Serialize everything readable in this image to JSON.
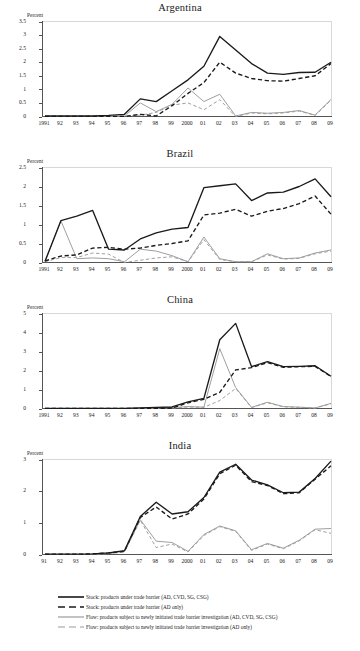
{
  "figure": {
    "ylabel": "Percent",
    "legend": [
      {
        "label": "Stock: products under trade barrier (AD, CVD, SG, CSG)",
        "color": "#1a1a1a",
        "style": "solid",
        "icon": "solid-black-line-icon"
      },
      {
        "label": "Stock: products under trade barrier (AD only)",
        "color": "#1a1a1a",
        "style": "dashed",
        "icon": "dashed-black-line-icon"
      },
      {
        "label": "Flow: products subject to newly initiated trade barrier investigation (AD, CVD, SG, CSG)",
        "color": "#9a9a9a",
        "style": "solid",
        "icon": "solid-gray-line-icon"
      },
      {
        "label": "Flow: products subject to newly initiated trade barrier investigation (AD only)",
        "color": "#9a9a9a",
        "style": "dashed",
        "icon": "dashed-gray-line-icon"
      }
    ]
  },
  "chart_data": [
    {
      "type": "line",
      "title": "Argentina",
      "xlabel": "",
      "ylabel": "Percent",
      "grid": false,
      "legend_position": "below-figure",
      "ylim": [
        0,
        3.5
      ],
      "yticks": [
        "0",
        "0.5",
        "1",
        "1.5",
        "2",
        "2.5",
        "3",
        "3.5"
      ],
      "x": [
        "1991",
        "92",
        "93",
        "94",
        "95",
        "96",
        "97",
        "98",
        "99",
        "2000",
        "01",
        "02",
        "03",
        "04",
        "05",
        "06",
        "07",
        "08",
        "09"
      ],
      "series": [
        {
          "name": "Stock: products under trade barrier (AD, CVD, SG, CSG)",
          "color": "#1a1a1a",
          "style": "solid",
          "values": [
            0.02,
            0.02,
            0.02,
            0.02,
            0.04,
            0.08,
            0.65,
            0.55,
            0.95,
            1.35,
            1.85,
            2.95,
            2.45,
            1.95,
            1.6,
            1.55,
            1.62,
            1.63,
            2.0
          ]
        },
        {
          "name": "Stock: products under trade barrier (AD only)",
          "color": "#1a1a1a",
          "style": "dashed",
          "values": [
            0.0,
            0.0,
            0.0,
            0.0,
            0.0,
            0.0,
            0.08,
            0.02,
            0.4,
            0.85,
            1.25,
            2.0,
            1.6,
            1.4,
            1.32,
            1.3,
            1.4,
            1.5,
            1.95
          ]
        },
        {
          "name": "Flow: products subject to newly initiated trade barrier investigation (AD, CVD, SG, CSG)",
          "color": "#9a9a9a",
          "style": "solid",
          "values": [
            0.0,
            0.0,
            0.0,
            0.0,
            0.0,
            0.02,
            0.5,
            0.18,
            0.45,
            1.05,
            0.55,
            0.82,
            0.02,
            0.15,
            0.12,
            0.15,
            0.22,
            0.05,
            0.63
          ]
        },
        {
          "name": "Flow: products subject to newly initiated trade barrier investigation (AD only)",
          "color": "#9a9a9a",
          "style": "dashed",
          "values": [
            0.0,
            0.0,
            0.0,
            0.0,
            0.0,
            0.0,
            0.05,
            0.15,
            0.42,
            0.5,
            0.25,
            0.62,
            0.0,
            0.13,
            0.1,
            0.13,
            0.2,
            0.04,
            0.6
          ]
        }
      ]
    },
    {
      "type": "line",
      "title": "Brazil",
      "xlabel": "",
      "ylabel": "Percent",
      "grid": false,
      "legend_position": "below-figure",
      "ylim": [
        0,
        2.5
      ],
      "yticks": [
        "0",
        "0.5",
        "1",
        "1.5",
        "2",
        "2.5"
      ],
      "x": [
        "1991",
        "92",
        "93",
        "94",
        "95",
        "96",
        "97",
        "98",
        "99",
        "2000",
        "01",
        "02",
        "03",
        "04",
        "05",
        "06",
        "07",
        "08",
        "09"
      ],
      "series": [
        {
          "name": "Stock: products under trade barrier (AD, CVD, SG, CSG)",
          "color": "#1a1a1a",
          "style": "solid",
          "values": [
            0.03,
            1.1,
            1.22,
            1.37,
            0.35,
            0.33,
            0.62,
            0.78,
            0.88,
            0.92,
            1.97,
            2.02,
            2.07,
            1.63,
            1.83,
            1.85,
            2.0,
            2.2,
            1.73
          ]
        },
        {
          "name": "Stock: products under trade barrier (AD only)",
          "color": "#1a1a1a",
          "style": "dashed",
          "values": [
            0.04,
            0.17,
            0.2,
            0.38,
            0.4,
            0.35,
            0.38,
            0.45,
            0.5,
            0.57,
            1.25,
            1.3,
            1.4,
            1.22,
            1.35,
            1.42,
            1.55,
            1.75,
            1.27
          ]
        },
        {
          "name": "Flow: products subject to newly initiated trade barrier investigation (AD, CVD, SG, CSG)",
          "color": "#9a9a9a",
          "style": "solid",
          "values": [
            0.02,
            1.1,
            0.1,
            0.12,
            0.1,
            0.02,
            0.35,
            0.3,
            0.18,
            0.02,
            0.67,
            0.1,
            0.02,
            0.02,
            0.23,
            0.1,
            0.12,
            0.25,
            0.33
          ]
        },
        {
          "name": "Flow: products subject to newly initiated trade barrier investigation (AD only)",
          "color": "#9a9a9a",
          "style": "dashed",
          "values": [
            0.02,
            0.13,
            0.13,
            0.25,
            0.22,
            0.0,
            0.06,
            0.12,
            0.15,
            0.02,
            0.6,
            0.08,
            0.02,
            0.02,
            0.2,
            0.09,
            0.11,
            0.23,
            0.3
          ]
        }
      ]
    },
    {
      "type": "line",
      "title": "China",
      "xlabel": "",
      "ylabel": "Percent",
      "grid": false,
      "legend_position": "below-figure",
      "ylim": [
        0,
        5
      ],
      "yticks": [
        "0",
        "1",
        "2",
        "3",
        "4",
        "5"
      ],
      "x": [
        "1991",
        "92",
        "93",
        "94",
        "95",
        "96",
        "97",
        "98",
        "99",
        "2000",
        "01",
        "02",
        "03",
        "04",
        "05",
        "06",
        "07",
        "08",
        "09"
      ],
      "series": [
        {
          "name": "Stock: products under trade barrier (AD, CVD, SG, CSG)",
          "color": "#1a1a1a",
          "style": "solid",
          "values": [
            0.01,
            0.01,
            0.01,
            0.01,
            0.01,
            0.01,
            0.03,
            0.06,
            0.08,
            0.35,
            0.53,
            3.62,
            4.48,
            2.2,
            2.47,
            2.2,
            2.22,
            2.25,
            1.7
          ]
        },
        {
          "name": "Stock: products under trade barrier (AD only)",
          "color": "#1a1a1a",
          "style": "dashed",
          "values": [
            0.0,
            0.0,
            0.0,
            0.0,
            0.0,
            0.0,
            0.0,
            0.0,
            0.02,
            0.3,
            0.48,
            0.85,
            2.03,
            2.15,
            2.42,
            2.17,
            2.2,
            2.22,
            1.68
          ]
        },
        {
          "name": "Flow: products subject to newly initiated trade barrier investigation (AD, CVD, SG, CSG)",
          "color": "#9a9a9a",
          "style": "solid",
          "values": [
            0.0,
            0.0,
            0.0,
            0.0,
            0.0,
            0.0,
            0.02,
            0.03,
            0.05,
            0.1,
            0.07,
            3.15,
            1.1,
            0.06,
            0.33,
            0.1,
            0.07,
            0.03,
            0.27
          ]
        },
        {
          "name": "Flow: products subject to newly initiated trade barrier investigation (AD only)",
          "color": "#9a9a9a",
          "style": "dashed",
          "values": [
            0.0,
            0.0,
            0.0,
            0.0,
            0.0,
            0.0,
            0.0,
            0.0,
            0.02,
            0.08,
            0.06,
            0.42,
            1.05,
            0.05,
            0.3,
            0.09,
            0.06,
            0.02,
            0.25
          ]
        }
      ]
    },
    {
      "type": "line",
      "title": "India",
      "xlabel": "",
      "ylabel": "Percent",
      "grid": false,
      "legend_position": "below-figure",
      "ylim": [
        0,
        3
      ],
      "yticks": [
        "0",
        "1",
        "2",
        "3"
      ],
      "x": [
        "91",
        "92",
        "93",
        "94",
        "95",
        "96",
        "97",
        "98",
        "99",
        "2000",
        "01",
        "02",
        "03",
        "04",
        "05",
        "06",
        "07",
        "08",
        "09"
      ],
      "series": [
        {
          "name": "Stock: products under trade barrier (AD, CVD, SG, CSG)",
          "color": "#1a1a1a",
          "style": "solid",
          "values": [
            0.01,
            0.01,
            0.01,
            0.02,
            0.05,
            0.12,
            1.2,
            1.65,
            1.28,
            1.35,
            1.8,
            2.6,
            2.85,
            2.35,
            2.2,
            1.95,
            1.97,
            2.4,
            2.95
          ]
        },
        {
          "name": "Stock: products under trade barrier (AD only)",
          "color": "#1a1a1a",
          "style": "dashed",
          "values": [
            0.01,
            0.01,
            0.01,
            0.02,
            0.05,
            0.1,
            1.17,
            1.5,
            1.12,
            1.28,
            1.75,
            2.55,
            2.82,
            2.3,
            2.18,
            1.92,
            1.95,
            2.38,
            2.8
          ]
        },
        {
          "name": "Flow: products subject to newly initiated trade barrier investigation (AD, CVD, SG, CSG)",
          "color": "#9a9a9a",
          "style": "solid",
          "values": [
            0.0,
            0.0,
            0.0,
            0.01,
            0.03,
            0.1,
            1.1,
            0.42,
            0.38,
            0.1,
            0.63,
            0.9,
            0.75,
            0.15,
            0.35,
            0.2,
            0.45,
            0.8,
            0.82
          ]
        },
        {
          "name": "Flow: products subject to newly initiated trade barrier investigation (AD only)",
          "color": "#9a9a9a",
          "style": "dashed",
          "values": [
            0.0,
            0.0,
            0.0,
            0.01,
            0.03,
            0.08,
            1.08,
            0.22,
            0.33,
            0.08,
            0.6,
            0.88,
            0.73,
            0.13,
            0.33,
            0.18,
            0.43,
            0.78,
            0.67
          ]
        }
      ]
    }
  ]
}
